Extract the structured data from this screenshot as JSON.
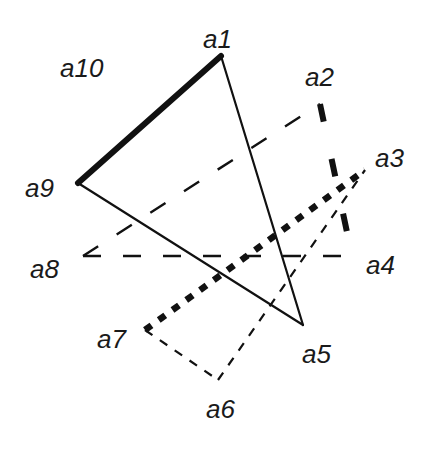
{
  "diagram": {
    "type": "graph",
    "nodes": [
      {
        "id": "a1",
        "label": "a1",
        "x": 221,
        "y": 56,
        "label_x": 203,
        "label_y": 48
      },
      {
        "id": "a2",
        "label": "a2",
        "x": 320,
        "y": 104,
        "label_x": 305,
        "label_y": 86
      },
      {
        "id": "a3",
        "label": "a3",
        "x": 365,
        "y": 170,
        "label_x": 375,
        "label_y": 167
      },
      {
        "id": "a4",
        "label": "a4",
        "x": 352,
        "y": 256,
        "label_x": 366,
        "label_y": 274
      },
      {
        "id": "a5",
        "label": "a5",
        "x": 303,
        "y": 325,
        "label_x": 302,
        "label_y": 363
      },
      {
        "id": "a6",
        "label": "a6",
        "x": 218,
        "y": 380,
        "label_x": 206,
        "label_y": 418
      },
      {
        "id": "a7",
        "label": "a7",
        "x": 145,
        "y": 330,
        "label_x": 97,
        "label_y": 348
      },
      {
        "id": "a8",
        "label": "a8",
        "x": 83,
        "y": 256,
        "label_x": 30,
        "label_y": 278
      },
      {
        "id": "a9",
        "label": "a9",
        "x": 78,
        "y": 183,
        "label_x": 25,
        "label_y": 197
      },
      {
        "id": "a10",
        "label": "a10",
        "x": 0,
        "y": 0,
        "label_x": 60,
        "label_y": 77
      }
    ],
    "edges": [
      {
        "from": "a1",
        "to": "a9",
        "style": "thick-solid"
      },
      {
        "from": "a1",
        "to": "a5",
        "style": "thin-solid"
      },
      {
        "from": "a9",
        "to": "a5",
        "style": "thin-solid"
      },
      {
        "from": "a2",
        "to": "a4",
        "style": "thick-dashed"
      },
      {
        "from": "a8",
        "to": "a4",
        "style": "medium-dashed"
      },
      {
        "from": "a8",
        "to": "a2",
        "style": "medium-dashed"
      },
      {
        "from": "a7",
        "to": "a3",
        "style": "thick-dotted"
      },
      {
        "from": "a7",
        "to": "a6",
        "style": "thin-dashed"
      },
      {
        "from": "a6",
        "to": "a3",
        "style": "thin-dashed"
      }
    ],
    "colors": {
      "line": "#111111",
      "label": "#1a1a1a",
      "background": "#ffffff"
    }
  }
}
